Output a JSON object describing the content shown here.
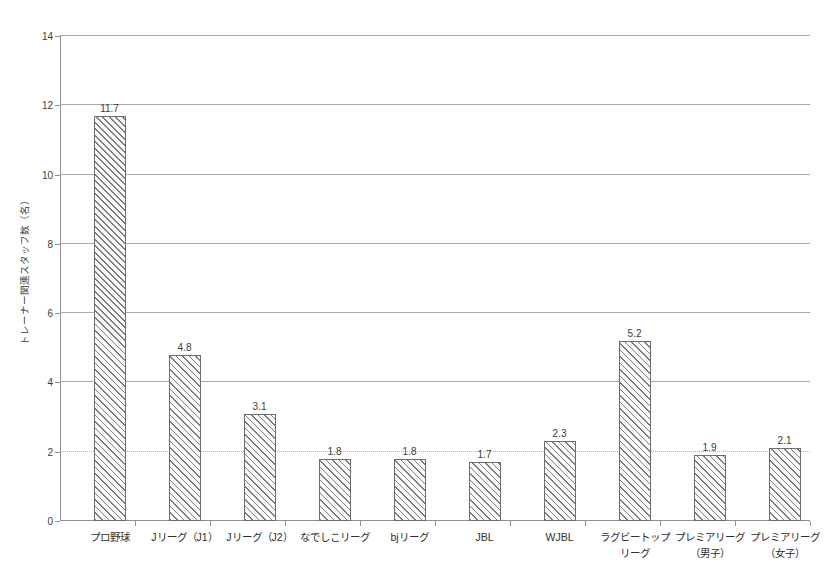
{
  "chart_data": {
    "type": "bar",
    "title": "",
    "subtitle": "",
    "xlabel": "",
    "ylabel": "トレーナー関連スタッフ数（名）",
    "ylim": [
      0,
      14
    ],
    "ytick_interval": 2,
    "yticks": [
      "0",
      "2",
      "4",
      "6",
      "8",
      "10",
      "12",
      "14"
    ],
    "grid": "horizontal",
    "legend": "none",
    "categories": [
      "プロ野球",
      "Jリーグ（J1）",
      "Jリーグ（J2）",
      "なでしこリーグ",
      "bjリーグ",
      "JBL",
      "WJBL",
      "ラグビートップ\nリーグ",
      "プレミアリーグ\n（男子）",
      "プレミアリーグ\n（女子）"
    ],
    "values": [
      11.7,
      4.8,
      3.1,
      1.8,
      1.8,
      1.7,
      2.3,
      5.2,
      1.9,
      2.1
    ],
    "value_labels": [
      "11.7",
      "4.8",
      "3.1",
      "1.8",
      "1.8",
      "1.7",
      "2.3",
      "5.2",
      "1.9",
      "2.1"
    ],
    "bar_style": {
      "fill": "#fbfbfa",
      "hatch": "diagonal-forward",
      "hatch_color": "#7c7c7c",
      "border_color": "#6d6d6d"
    },
    "axis_color": "#8f8f8f",
    "gridline_color": "#a9a9a9",
    "text_color": "#3c3c3c"
  }
}
